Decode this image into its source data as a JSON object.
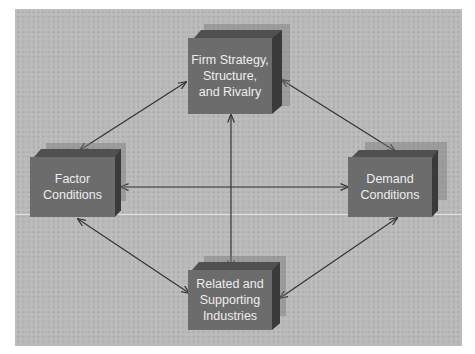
{
  "diagram": {
    "colors": {
      "background": "#b9b9b9",
      "box_front": "#6c6c6c",
      "box_top": "#505050",
      "box_side": "#3a3a3a",
      "box_text": "#eeeeee",
      "arrow": "#333333"
    },
    "nodes": {
      "top": {
        "label_lines": [
          "Firm Strategy,",
          "Structure,",
          "and Rivalry"
        ]
      },
      "left": {
        "label_lines": [
          "Factor",
          "Conditions"
        ]
      },
      "right": {
        "label_lines": [
          "Demand",
          "Conditions"
        ]
      },
      "bottom": {
        "label_lines": [
          "Related and",
          "Supporting",
          "Industries"
        ]
      }
    },
    "edges": [
      {
        "from": "top",
        "to": "left",
        "type": "bidirectional"
      },
      {
        "from": "top",
        "to": "right",
        "type": "bidirectional"
      },
      {
        "from": "left",
        "to": "right",
        "type": "bidirectional"
      },
      {
        "from": "top",
        "to": "bottom",
        "type": "bidirectional"
      },
      {
        "from": "left",
        "to": "bottom",
        "type": "bidirectional"
      },
      {
        "from": "right",
        "to": "bottom",
        "type": "bidirectional"
      }
    ]
  }
}
